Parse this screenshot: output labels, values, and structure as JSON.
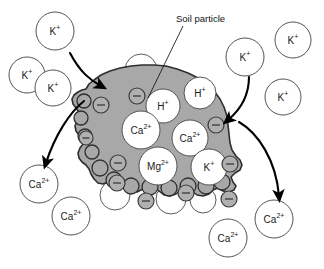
{
  "figure": {
    "background_color": "#ffffff",
    "particle_fill": "#a8a8a8",
    "particle_stroke": "#2e2e2e",
    "ion_fill": "#ffffff",
    "ion_stroke": "#4a4a4a",
    "charge_fill": "#b0b0b0",
    "charge_stroke": "#3a3a3a",
    "arrow_color": "#000000",
    "text_color": "#111111"
  },
  "annotations": [
    {
      "name": "soil-particle-label",
      "text": "Soil particle",
      "x": 176,
      "y": 22
    }
  ],
  "leader_line": {
    "name": "soil-particle-leader",
    "from_x": 183,
    "from_y": 26,
    "to_x": 148,
    "to_y": 98
  },
  "particle": {
    "name": "soil-particle-shape",
    "path": "M 86 89 L 89 84 L 94 80 L 101 75 L 110 71 L 120 68 L 131 66 L 142 65 L 154 65 L 166 66 L 177 69 L 188 73 L 198 78 L 207 84 L 214 91 L 220 99 L 224 107 L 227 116 L 228 125 L 229 134 L 230 143 L 232 150 L 236 156 L 240 160 L 242 165 L 240 170 L 235 173 L 231 177 L 233 182 L 236 186 L 234 190 L 229 192 L 223 191 L 218 188 L 213 190 L 209 194 L 203 196 L 197 195 L 192 191 L 187 188 L 181 190 L 176 194 L 170 196 L 164 195 L 159 191 L 154 187 L 148 186 L 143 189 L 137 192 L 131 192 L 126 189 L 122 185 L 118 181 L 113 180 L 108 182 L 103 184 L 98 183 L 94 179 L 91 174 L 89 169 L 86 165 L 82 162 L 79 158 L 78 153 L 80 148 L 83 144 L 82 139 L 79 135 L 76 131 L 75 126 L 77 121 L 80 117 L 79 112 L 76 108 L 73 104 L 72 99 L 74 95 L 78 92 L 82 90 Z"
  },
  "particle_bumps": [
    {
      "name": "particle-lobe",
      "cx": 84,
      "cy": 101,
      "r": 7
    },
    {
      "name": "particle-lobe",
      "cx": 81,
      "cy": 118,
      "r": 7
    },
    {
      "name": "particle-lobe",
      "cx": 85,
      "cy": 136,
      "r": 7
    },
    {
      "name": "particle-lobe",
      "cx": 92,
      "cy": 152,
      "r": 7
    },
    {
      "name": "particle-lobe",
      "cx": 100,
      "cy": 168,
      "r": 8
    },
    {
      "name": "particle-lobe",
      "cx": 114,
      "cy": 180,
      "r": 8
    },
    {
      "name": "particle-lobe",
      "cx": 131,
      "cy": 186,
      "r": 8
    },
    {
      "name": "particle-lobe",
      "cx": 150,
      "cy": 187,
      "r": 8
    },
    {
      "name": "particle-lobe",
      "cx": 169,
      "cy": 188,
      "r": 8
    },
    {
      "name": "particle-lobe",
      "cx": 188,
      "cy": 186,
      "r": 8
    },
    {
      "name": "particle-lobe",
      "cx": 206,
      "cy": 186,
      "r": 8
    },
    {
      "name": "particle-lobe",
      "cx": 222,
      "cy": 182,
      "r": 8
    }
  ],
  "bound_ions": [
    {
      "name": "bound-ion-h",
      "label": "H",
      "charge": "+",
      "cx": 163,
      "cy": 106,
      "r": 17,
      "font_size": 10
    },
    {
      "name": "bound-ion-ca1",
      "label": "Ca",
      "charge": "2+",
      "cx": 141,
      "cy": 130,
      "r": 19,
      "font_size": 10
    },
    {
      "name": "bound-ion-ca2",
      "label": "Ca",
      "charge": "2+",
      "cx": 190,
      "cy": 138,
      "r": 18,
      "font_size": 10
    },
    {
      "name": "bound-ion-mg",
      "label": "Mg",
      "charge": "2+",
      "cx": 158,
      "cy": 166,
      "r": 19,
      "font_size": 10
    },
    {
      "name": "bound-ion-k",
      "label": "K",
      "charge": "+",
      "cx": 209,
      "cy": 167,
      "r": 18,
      "font_size": 10
    }
  ],
  "edge_ions": [
    {
      "name": "edge-ion-h-top",
      "label": "H",
      "charge": "+",
      "cx": 200,
      "cy": 93,
      "r": 16,
      "font_size": 10
    }
  ],
  "halo_circles": [
    {
      "name": "surface-halo",
      "cx": 141,
      "cy": 70,
      "r": 16
    },
    {
      "name": "surface-halo",
      "cx": 99,
      "cy": 146,
      "r": 15
    },
    {
      "name": "surface-halo",
      "cx": 115,
      "cy": 195,
      "r": 15
    },
    {
      "name": "surface-halo",
      "cx": 171,
      "cy": 199,
      "r": 15
    },
    {
      "name": "surface-halo",
      "cx": 203,
      "cy": 200,
      "r": 13
    }
  ],
  "charges": [
    {
      "name": "negative-charge",
      "cx": 101,
      "cy": 105,
      "r": 8
    },
    {
      "name": "negative-charge",
      "cx": 137,
      "cy": 96,
      "r": 8
    },
    {
      "name": "negative-charge",
      "cx": 216,
      "cy": 125,
      "r": 8
    },
    {
      "name": "negative-charge",
      "cx": 118,
      "cy": 163,
      "r": 8
    },
    {
      "name": "negative-charge",
      "cx": 117,
      "cy": 183,
      "r": 8
    },
    {
      "name": "negative-charge",
      "cx": 146,
      "cy": 201,
      "r": 8
    },
    {
      "name": "negative-charge",
      "cx": 186,
      "cy": 193,
      "r": 8
    },
    {
      "name": "negative-charge",
      "cx": 230,
      "cy": 164,
      "r": 8
    },
    {
      "name": "negative-charge",
      "cx": 229,
      "cy": 199,
      "r": 8
    },
    {
      "name": "negative-charge",
      "cx": 86,
      "cy": 138,
      "r": 7
    }
  ],
  "free_ions": [
    {
      "name": "free-ion-k-topleft",
      "label": "K",
      "charge": "+",
      "cx": 55,
      "cy": 31,
      "r": 19,
      "font_size": 10
    },
    {
      "name": "free-ion-k-left-upper",
      "label": "K",
      "charge": "+",
      "cx": 27,
      "cy": 75,
      "r": 18,
      "font_size": 10
    },
    {
      "name": "free-ion-k-left-lower",
      "label": "K",
      "charge": "+",
      "cx": 53,
      "cy": 88,
      "r": 18,
      "font_size": 10
    },
    {
      "name": "free-ion-k-topright",
      "label": "K",
      "charge": "+",
      "cx": 245,
      "cy": 57,
      "r": 19,
      "font_size": 10
    },
    {
      "name": "free-ion-k-farright",
      "label": "K",
      "charge": "+",
      "cx": 293,
      "cy": 40,
      "r": 18,
      "font_size": 10
    },
    {
      "name": "free-ion-k-right",
      "label": "K",
      "charge": "+",
      "cx": 283,
      "cy": 97,
      "r": 18,
      "font_size": 10
    },
    {
      "name": "free-ion-ca-leftout",
      "label": "Ca",
      "charge": "2+",
      "cx": 39,
      "cy": 184,
      "r": 19,
      "font_size": 10
    },
    {
      "name": "free-ion-ca-bottomleft",
      "label": "Ca",
      "charge": "2+",
      "cx": 71,
      "cy": 216,
      "r": 19,
      "font_size": 10
    },
    {
      "name": "free-ion-ca-bottommid",
      "label": "Ca",
      "charge": "2+",
      "cx": 228,
      "cy": 238,
      "r": 19,
      "font_size": 10
    },
    {
      "name": "free-ion-ca-rightout",
      "label": "Ca",
      "charge": "2+",
      "cx": 274,
      "cy": 219,
      "r": 19,
      "font_size": 10
    }
  ],
  "arrows": [
    {
      "name": "arrow-k-in-left",
      "description": "potassium entering particle from upper left",
      "path": "M 70 53 C 80 72, 90 80, 101 86"
    },
    {
      "name": "arrow-ca-out-left",
      "description": "calcium leaving particle toward lower left",
      "path": "M 84 101 C 70 112, 55 135, 46 163"
    },
    {
      "name": "arrow-k-in-right",
      "description": "potassium entering particle from upper right",
      "path": "M 249 77 C 249 95, 240 110, 228 120"
    },
    {
      "name": "arrow-ca-out-right",
      "description": "calcium leaving particle toward lower right",
      "path": "M 239 122 C 258 133, 276 160, 279 196"
    }
  ],
  "chart_data": {
    "type": "diagram",
    "legend_note": "Negatively charged soil particle surface attracts and holds cations; potassium ions enter while calcium ions are released to soil solution.",
    "bound_cations": [
      "H+",
      "Ca2+",
      "Ca2+",
      "Mg2+",
      "K+",
      "H+"
    ],
    "solution_cations": [
      "K+",
      "K+",
      "K+",
      "K+",
      "K+",
      "K+",
      "Ca2+",
      "Ca2+",
      "Ca2+",
      "Ca2+"
    ],
    "negative_site_count": 10,
    "incoming_ion": "K+",
    "outgoing_ion": "Ca2+"
  }
}
